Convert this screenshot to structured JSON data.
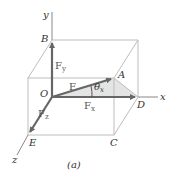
{
  "figure": {
    "caption": "(a)",
    "axes": {
      "x": "x",
      "y": "y",
      "z": "z"
    },
    "points": {
      "O": "O",
      "A": "A",
      "B": "B",
      "C": "C",
      "D": "D",
      "E": "E"
    },
    "vectors": {
      "F": "F",
      "Fx": {
        "base": "F",
        "sub": "x"
      },
      "Fy": {
        "base": "F",
        "sub": "y"
      },
      "Fz": {
        "base": "F",
        "sub": "z"
      }
    },
    "angle": {
      "base": "θ",
      "sub": "x"
    },
    "colors": {
      "box_edge": "#bbbbbb",
      "vector": "#666666",
      "shade": "#e2e2e2",
      "axis": "#888888"
    }
  }
}
